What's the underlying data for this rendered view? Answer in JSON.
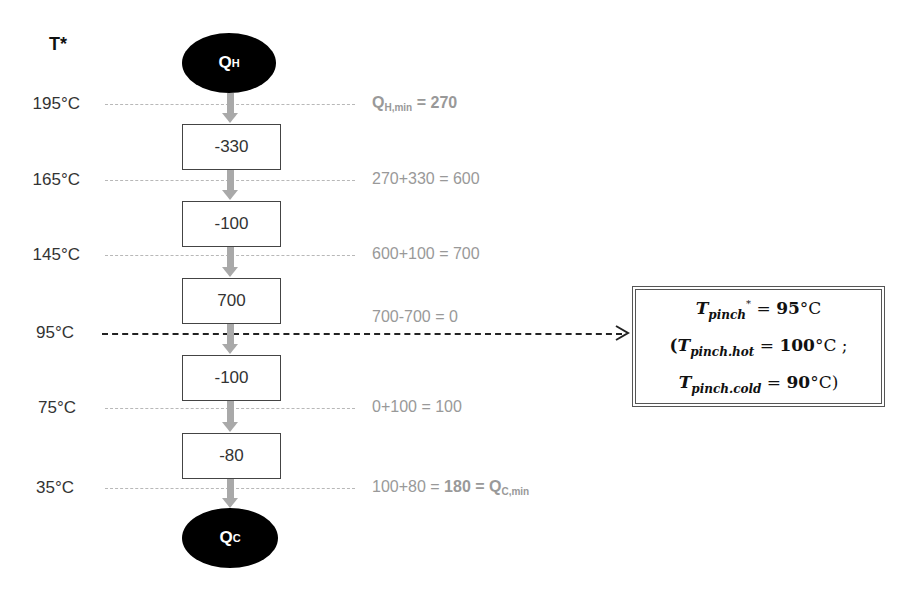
{
  "diagram": {
    "type": "heat cascade (problem table) diagram",
    "axis_header": "T*",
    "hot_utility": {
      "label": "Q",
      "sub": "H"
    },
    "cold_utility": {
      "label": "Q",
      "sub": "C"
    },
    "temperature_levels": [
      {
        "label": "195°C",
        "calc_prefix": "",
        "calc_main": "Q",
        "calc_sub": "H,min",
        "calc_suffix": "= 270"
      },
      {
        "label": "165°C",
        "calc": "270+330 = 600"
      },
      {
        "label": "145°C",
        "calc": "600+100 = 700"
      },
      {
        "label": "95°C",
        "calc": "700-700 = 0",
        "is_pinch": true
      },
      {
        "label": "75°C",
        "calc": "0+100 = 100"
      },
      {
        "label": "35°C",
        "calc_prefix": "100+80 = ",
        "calc_main": "180 = Q",
        "calc_sub": "C,min",
        "calc_suffix": ""
      }
    ],
    "intervals": [
      {
        "value": "-330"
      },
      {
        "value": "-100"
      },
      {
        "value": "700"
      },
      {
        "value": "-100"
      },
      {
        "value": "-80"
      }
    ],
    "pinch_box": {
      "line1": {
        "var": "T",
        "sub": "pinch",
        "sup": "*",
        "eq": " = ",
        "val": "95",
        "unit": "°C"
      },
      "line2": {
        "open": "(",
        "var": "T",
        "sub": "pinch.hot",
        "eq": " = ",
        "val": "100",
        "unit": "°C ;"
      },
      "line3": {
        "var": "T",
        "sub": "pinch.cold",
        "eq": " = ",
        "val": "90",
        "unit": "°C)"
      }
    },
    "colors": {
      "guide_line": "#b8b8b8",
      "pinch_line": "#222222",
      "flow_arrow": "#a9a9a9",
      "calc_text": "#999999",
      "utility_fill": "#000000"
    }
  }
}
